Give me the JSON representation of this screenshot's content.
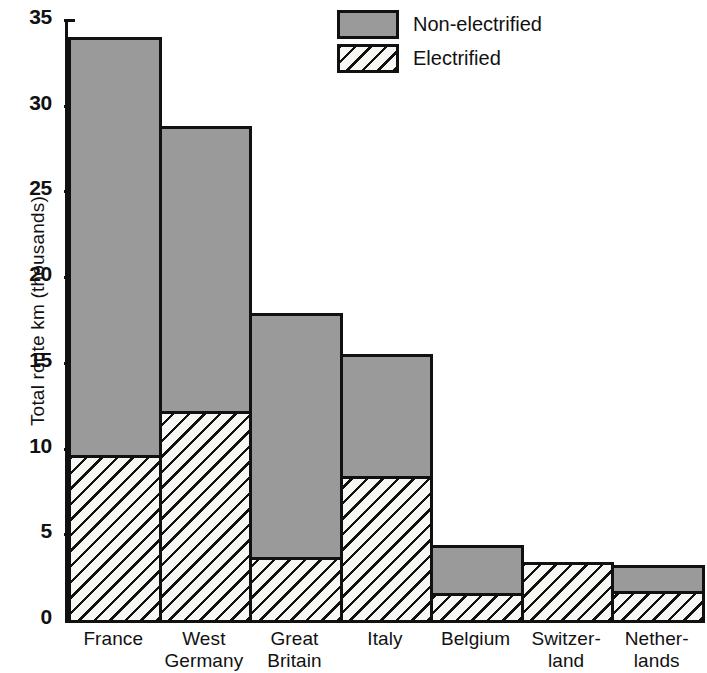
{
  "chart_data": {
    "type": "bar",
    "stacked": true,
    "title": "",
    "xlabel": "",
    "ylabel": "Total route km (thousands)",
    "ylim": [
      0,
      35
    ],
    "yticks": [
      0,
      5,
      10,
      15,
      20,
      25,
      30,
      35
    ],
    "ytick_labels": [
      "0",
      "5",
      "10",
      "15",
      "20",
      "25",
      "30",
      "35"
    ],
    "grid": false,
    "legend_position": "top-center",
    "categories": [
      "France",
      "West Germany",
      "Great Britain",
      "Italy",
      "Belgium",
      "Switzerland",
      "Netherlands"
    ],
    "category_lines": [
      [
        "France",
        ""
      ],
      [
        "West",
        "Germany"
      ],
      [
        "Great",
        "Britain"
      ],
      [
        "Italy",
        ""
      ],
      [
        "Belgium",
        ""
      ],
      [
        "Switzer-",
        "land"
      ],
      [
        "Nether-",
        "lands"
      ]
    ],
    "series": [
      {
        "name": "Electrified",
        "color": "#ffffff",
        "pattern": "diagonal-hatch",
        "values": [
          9.6,
          12.2,
          3.7,
          8.4,
          1.6,
          3.4,
          1.7
        ]
      },
      {
        "name": "Non-electrified",
        "color": "#9a9a9a",
        "pattern": "solid",
        "values": [
          24.4,
          16.6,
          14.2,
          7.1,
          2.8,
          0.0,
          1.5
        ]
      }
    ],
    "totals": [
      34.0,
      28.8,
      17.9,
      15.5,
      4.4,
      3.4,
      3.2
    ]
  },
  "legend": {
    "items": [
      {
        "label": "Non-electrified",
        "key": "non-electrified"
      },
      {
        "label": "Electrified",
        "key": "electrified"
      }
    ]
  },
  "axis": {
    "y_title": "Total route km (thousands)"
  },
  "colors": {
    "non_electrified": "#9a9a9a",
    "electrified": "#ffffff",
    "ink": "#111111",
    "background": "#ffffff"
  }
}
